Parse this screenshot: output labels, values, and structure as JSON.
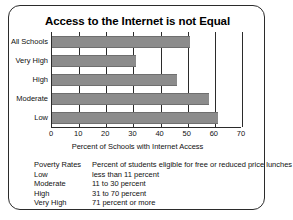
{
  "chart_data": {
    "type": "bar",
    "orientation": "horizontal",
    "title": "Access to the Internet is not Equal",
    "xlabel": "Percent of Schools with Internet Access",
    "ylabel": "",
    "categories": [
      "All Schools",
      "Very High",
      "High",
      "Moderate",
      "Low"
    ],
    "values": [
      51,
      31,
      46,
      58,
      61
    ],
    "xlim": [
      0,
      70
    ],
    "xticks": [
      0,
      10,
      20,
      30,
      40,
      50,
      60,
      70
    ],
    "xticklabels": [
      "0",
      "10",
      "20",
      "30",
      "40",
      "50",
      "60",
      "70"
    ],
    "grid": "vertical",
    "legend": "none",
    "bar_color": "#8c8c8c",
    "axis_color": "#2b2b2b",
    "annotations": [
      "Poverty Rates: Percent of students eligible for free or reduced price lunches",
      "Low: less than 11 percent",
      "Moderate: 11 to 30 percent",
      "High: 31 to 70 percent",
      "Very High: 71 percent or more"
    ]
  },
  "notes": {
    "rows": [
      {
        "term": "Poverty Rates",
        "definition": "Percent of students eligible for free or reduced price lunches"
      },
      {
        "term": "Low",
        "definition": "less than 11 percent"
      },
      {
        "term": "Moderate",
        "definition": "11 to 30 percent"
      },
      {
        "term": "High",
        "definition": "31 to 70 percent"
      },
      {
        "term": "Very High",
        "definition": "71 percent or more"
      }
    ]
  }
}
